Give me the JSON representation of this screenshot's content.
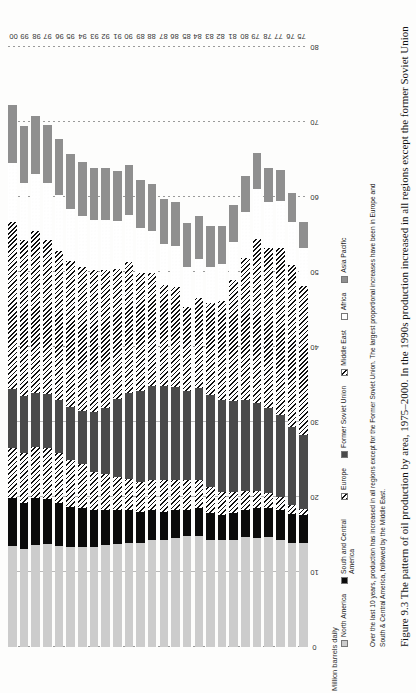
{
  "figure": {
    "caption_prefix": "Figure 9.3",
    "caption_text": "The pattern of oil production by area, 1975–2000. In the 1990s production increased in all regions except the former Soviet Union"
  },
  "note": {
    "text": "Over the last 10 years, production has increased in all regions except for the Former Soviet Union. The largest proportional increases have been in Europe and South & Central America, followed by the Middle East."
  },
  "chart_data": {
    "type": "bar",
    "orientation": "vertical-stacked-rotated",
    "title": "",
    "xlabel": "",
    "ylabel": "Million barrels daily",
    "ylim": [
      0,
      80
    ],
    "yticks": [
      0,
      10,
      20,
      30,
      40,
      50,
      60,
      70,
      80
    ],
    "grid": true,
    "legend_position": "below",
    "categories": [
      "75",
      "76",
      "77",
      "78",
      "79",
      "80",
      "81",
      "82",
      "83",
      "84",
      "85",
      "86",
      "87",
      "88",
      "89",
      "90",
      "91",
      "92",
      "93",
      "94",
      "95",
      "96",
      "97",
      "98",
      "99",
      "00"
    ],
    "series": [
      {
        "name": "North America",
        "color": "#cccccc",
        "pattern": "solid",
        "values": [
          13.8,
          13.8,
          14.2,
          14.6,
          14.5,
          14.6,
          14.3,
          14.2,
          14.3,
          14.8,
          14.8,
          14.5,
          14.2,
          14.2,
          13.8,
          13.8,
          13.7,
          13.6,
          13.3,
          13.3,
          13.3,
          13.5,
          13.7,
          13.6,
          13.1,
          13.4
        ]
      },
      {
        "name": "South and Central America",
        "color": "#0b0b0b",
        "pattern": "solid",
        "values": [
          3.8,
          3.9,
          4.0,
          3.9,
          4.0,
          3.6,
          3.5,
          3.4,
          3.6,
          3.7,
          3.5,
          3.7,
          3.8,
          4.0,
          4.2,
          4.4,
          4.6,
          4.7,
          4.9,
          5.2,
          5.4,
          5.7,
          6.0,
          6.3,
          6.1,
          6.4
        ]
      },
      {
        "name": "Europe",
        "color": "#111111",
        "pattern": "diagonal-hatch",
        "values": [
          0.8,
          1.2,
          1.8,
          2.0,
          2.3,
          2.6,
          2.8,
          3.0,
          3.4,
          3.8,
          4.0,
          4.1,
          4.2,
          4.0,
          4.0,
          4.2,
          4.4,
          4.7,
          5.1,
          5.9,
          6.2,
          6.6,
          6.8,
          6.7,
          6.7,
          6.7
        ]
      },
      {
        "name": "Former Soviet Union",
        "color": "#4a4a4a",
        "pattern": "solid",
        "values": [
          9.8,
          10.4,
          10.9,
          11.4,
          11.7,
          12.1,
          12.2,
          12.3,
          12.3,
          12.2,
          11.8,
          12.4,
          12.6,
          12.6,
          12.1,
          11.4,
          10.4,
          8.9,
          8.0,
          7.1,
          7.1,
          7.1,
          7.2,
          7.3,
          7.5,
          7.9
        ]
      },
      {
        "name": "Middle East",
        "color": "#111111",
        "pattern": "diagonal-hatch",
        "values": [
          19.9,
          21.6,
          22.3,
          21.3,
          21.9,
          18.9,
          16.1,
          13.2,
          12.2,
          12.0,
          11.2,
          13.3,
          13.5,
          15.1,
          15.7,
          17.5,
          17.3,
          18.4,
          18.9,
          19.2,
          19.4,
          19.9,
          20.6,
          21.6,
          20.9,
          22.3
        ]
      },
      {
        "name": "Africa",
        "color": "#2a2a2a",
        "pattern": "dotted",
        "values": [
          5.1,
          5.7,
          6.2,
          6.1,
          6.7,
          6.2,
          5.1,
          4.9,
          4.9,
          5.2,
          5.3,
          5.4,
          5.4,
          5.6,
          6.0,
          6.3,
          6.4,
          6.6,
          6.7,
          6.8,
          7.0,
          7.4,
          7.6,
          7.6,
          7.6,
          7.8
        ]
      },
      {
        "name": "Asia Pacific",
        "color": "#8f8f8f",
        "pattern": "solid",
        "values": [
          3.4,
          3.9,
          4.2,
          4.5,
          4.8,
          4.8,
          4.9,
          5.1,
          5.4,
          5.7,
          5.9,
          5.9,
          6.0,
          6.2,
          6.4,
          6.6,
          6.7,
          6.9,
          7.0,
          7.1,
          7.3,
          7.5,
          7.7,
          7.7,
          7.5,
          7.8
        ]
      }
    ]
  },
  "legend": {
    "items": [
      {
        "label": "North America",
        "swatch": "na-swatch"
      },
      {
        "label": "South and Central America",
        "swatch": "sca-swatch"
      },
      {
        "label": "Europe",
        "swatch": "eu-swatch"
      },
      {
        "label": "Former Soviet Union",
        "swatch": "fsu-swatch"
      },
      {
        "label": "Middle East",
        "swatch": "me-swatch"
      },
      {
        "label": "Africa",
        "swatch": "af-swatch"
      },
      {
        "label": "Asia Pacific",
        "swatch": "ap-swatch"
      }
    ]
  }
}
